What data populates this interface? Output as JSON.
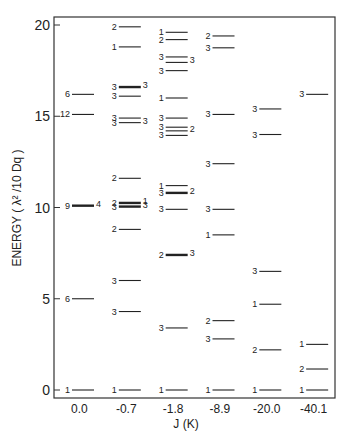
{
  "chart_data": {
    "type": "energy-level-diagram",
    "title": "",
    "xlabel": "J (K)",
    "ylabel": "ENERGY ( λ² /10 Dq )",
    "ylim": [
      0,
      20
    ],
    "yticks": [
      "0",
      "5",
      "10",
      "15",
      "20"
    ],
    "ytick_values": [
      0,
      5,
      10,
      15,
      20
    ],
    "grid": false,
    "legend": "none",
    "categories": [
      "0.0",
      "-0.7",
      "-1.8",
      "-8.9",
      "-20.0",
      "-40.1"
    ],
    "columns": [
      {
        "j": "0.0",
        "levels": [
          {
            "energy": 16.2,
            "left": "6"
          },
          {
            "energy": 15.1,
            "left": "12"
          },
          {
            "energy": 10.1,
            "left": "9",
            "right": "4",
            "thick": true
          },
          {
            "energy": 5.0,
            "left": "6"
          },
          {
            "energy": 0.0,
            "left": "1"
          }
        ]
      },
      {
        "j": "-0.7",
        "levels": [
          {
            "energy": 19.9,
            "left": "2"
          },
          {
            "energy": 18.8,
            "left": "1"
          },
          {
            "energy": 16.6,
            "left": "3",
            "right": "3",
            "thick": true
          },
          {
            "energy": 16.1,
            "left": "3"
          },
          {
            "energy": 14.9,
            "left": "3"
          },
          {
            "energy": 14.65,
            "left": "3",
            "right": "3"
          },
          {
            "energy": 11.6,
            "left": "2"
          },
          {
            "energy": 10.25,
            "left": "2",
            "right": "1",
            "thick": true
          },
          {
            "energy": 10.05,
            "left": "3",
            "right": "3",
            "thick": true
          },
          {
            "energy": 8.8,
            "left": "2"
          },
          {
            "energy": 6.0,
            "left": "3"
          },
          {
            "energy": 4.3,
            "left": "3"
          },
          {
            "energy": 0.0,
            "left": "1"
          }
        ]
      },
      {
        "j": "-1.8",
        "levels": [
          {
            "energy": 19.6,
            "left": "1"
          },
          {
            "energy": 19.2,
            "left": "2"
          },
          {
            "energy": 18.25,
            "left": "3"
          },
          {
            "energy": 17.95,
            "right": "3"
          },
          {
            "energy": 17.5,
            "left": "3"
          },
          {
            "energy": 16.0,
            "left": "1"
          },
          {
            "energy": 14.9,
            "left": "3"
          },
          {
            "energy": 14.4,
            "left": "3"
          },
          {
            "energy": 14.2,
            "right": "2"
          },
          {
            "energy": 13.95,
            "left": "3"
          },
          {
            "energy": 11.2,
            "left": "1"
          },
          {
            "energy": 10.8,
            "left": "3",
            "right": "2",
            "thick": true
          },
          {
            "energy": 9.9,
            "left": "3"
          },
          {
            "energy": 7.4,
            "left": "2",
            "right": "3",
            "thick": true
          },
          {
            "energy": 3.4,
            "left": "3"
          },
          {
            "energy": 0.0,
            "left": "1"
          }
        ]
      },
      {
        "j": "-8.9",
        "levels": [
          {
            "energy": 19.4,
            "left": "2"
          },
          {
            "energy": 18.75,
            "left": "3"
          },
          {
            "energy": 15.1,
            "left": "3"
          },
          {
            "energy": 12.4,
            "left": "3"
          },
          {
            "energy": 9.9,
            "left": "3"
          },
          {
            "energy": 8.5,
            "left": "1"
          },
          {
            "energy": 3.8,
            "left": "2"
          },
          {
            "energy": 2.8,
            "left": "3"
          },
          {
            "energy": 0.0,
            "left": "1"
          }
        ]
      },
      {
        "j": "-20.0",
        "levels": [
          {
            "energy": 15.4,
            "left": "3"
          },
          {
            "energy": 14.0,
            "left": "3"
          },
          {
            "energy": 6.5,
            "left": "3"
          },
          {
            "energy": 4.7,
            "left": "1"
          },
          {
            "energy": 2.2,
            "left": "2"
          },
          {
            "energy": 0.0,
            "left": "1"
          }
        ]
      },
      {
        "j": "-40.1",
        "levels": [
          {
            "energy": 16.2,
            "left": "3"
          },
          {
            "energy": 2.5,
            "left": "1"
          },
          {
            "energy": 1.15,
            "left": "2"
          },
          {
            "energy": 0.0,
            "left": "1"
          }
        ]
      }
    ]
  }
}
